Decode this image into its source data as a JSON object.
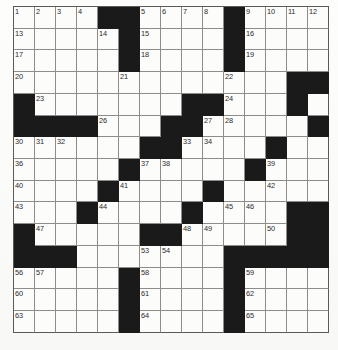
{
  "puzzle": {
    "type": "crossword-grid",
    "rows": 15,
    "columns": 15,
    "cell_size_px": 21,
    "colors": {
      "block": "#1a1a1a",
      "open": "#fcfcfb",
      "grid_line": "#8c8c8c",
      "border": "#5a5a5a",
      "number_text": "#2b2b2b",
      "page_background": "#ffffff"
    },
    "blocks": [
      [
        0,
        4
      ],
      [
        0,
        5
      ],
      [
        0,
        10
      ],
      [
        1,
        5
      ],
      [
        1,
        10
      ],
      [
        2,
        5
      ],
      [
        2,
        10
      ],
      [
        3,
        13
      ],
      [
        3,
        14
      ],
      [
        4,
        0
      ],
      [
        4,
        8
      ],
      [
        4,
        9
      ],
      [
        4,
        13
      ],
      [
        5,
        0
      ],
      [
        5,
        1
      ],
      [
        5,
        2
      ],
      [
        5,
        3
      ],
      [
        5,
        7
      ],
      [
        5,
        8
      ],
      [
        5,
        14
      ],
      [
        6,
        6
      ],
      [
        6,
        7
      ],
      [
        6,
        12
      ],
      [
        7,
        5
      ],
      [
        7,
        11
      ],
      [
        8,
        4
      ],
      [
        8,
        9
      ],
      [
        9,
        3
      ],
      [
        9,
        8
      ],
      [
        9,
        13
      ],
      [
        9,
        14
      ],
      [
        10,
        0
      ],
      [
        10,
        6
      ],
      [
        10,
        7
      ],
      [
        10,
        13
      ],
      [
        10,
        14
      ],
      [
        11,
        0
      ],
      [
        11,
        1
      ],
      [
        11,
        2
      ],
      [
        11,
        10
      ],
      [
        11,
        11
      ],
      [
        11,
        12
      ],
      [
        11,
        13
      ],
      [
        11,
        14
      ],
      [
        12,
        5
      ],
      [
        12,
        10
      ],
      [
        13,
        5
      ],
      [
        13,
        10
      ],
      [
        14,
        5
      ],
      [
        14,
        10
      ]
    ],
    "numbers": [
      {
        "row": 0,
        "col": 0,
        "n": "1"
      },
      {
        "row": 0,
        "col": 1,
        "n": "2"
      },
      {
        "row": 0,
        "col": 2,
        "n": "3"
      },
      {
        "row": 0,
        "col": 3,
        "n": "4"
      },
      {
        "row": 0,
        "col": 6,
        "n": "5"
      },
      {
        "row": 0,
        "col": 7,
        "n": "6"
      },
      {
        "row": 0,
        "col": 8,
        "n": "7"
      },
      {
        "row": 0,
        "col": 9,
        "n": "8"
      },
      {
        "row": 0,
        "col": 11,
        "n": "9"
      },
      {
        "row": 0,
        "col": 12,
        "n": "10"
      },
      {
        "row": 0,
        "col": 13,
        "n": "11"
      },
      {
        "row": 0,
        "col": 14,
        "n": "12"
      },
      {
        "row": 1,
        "col": 0,
        "n": "13"
      },
      {
        "row": 1,
        "col": 4,
        "n": "14"
      },
      {
        "row": 1,
        "col": 6,
        "n": "15"
      },
      {
        "row": 1,
        "col": 11,
        "n": "16"
      },
      {
        "row": 2,
        "col": 0,
        "n": "17"
      },
      {
        "row": 2,
        "col": 6,
        "n": "18"
      },
      {
        "row": 2,
        "col": 11,
        "n": "19"
      },
      {
        "row": 3,
        "col": 0,
        "n": "20"
      },
      {
        "row": 3,
        "col": 5,
        "n": "21"
      },
      {
        "row": 3,
        "col": 10,
        "n": "22"
      },
      {
        "row": 4,
        "col": 1,
        "n": "23"
      },
      {
        "row": 4,
        "col": 10,
        "n": "24"
      },
      {
        "row": 4,
        "col": 13,
        "n": "25"
      },
      {
        "row": 5,
        "col": 4,
        "n": "26"
      },
      {
        "row": 5,
        "col": 9,
        "n": "27"
      },
      {
        "row": 5,
        "col": 10,
        "n": "28"
      },
      {
        "row": 5,
        "col": 14,
        "n": "29"
      },
      {
        "row": 6,
        "col": 0,
        "n": "30"
      },
      {
        "row": 6,
        "col": 1,
        "n": "31"
      },
      {
        "row": 6,
        "col": 2,
        "n": "32"
      },
      {
        "row": 6,
        "col": 8,
        "n": "33"
      },
      {
        "row": 6,
        "col": 9,
        "n": "34"
      },
      {
        "row": 6,
        "col": 12,
        "n": "35"
      },
      {
        "row": 7,
        "col": 0,
        "n": "36"
      },
      {
        "row": 7,
        "col": 6,
        "n": "37"
      },
      {
        "row": 7,
        "col": 7,
        "n": "38"
      },
      {
        "row": 7,
        "col": 12,
        "n": "39"
      },
      {
        "row": 8,
        "col": 0,
        "n": "40"
      },
      {
        "row": 8,
        "col": 5,
        "n": "41"
      },
      {
        "row": 8,
        "col": 12,
        "n": "42"
      },
      {
        "row": 9,
        "col": 0,
        "n": "43"
      },
      {
        "row": 9,
        "col": 4,
        "n": "44"
      },
      {
        "row": 9,
        "col": 10,
        "n": "45"
      },
      {
        "row": 9,
        "col": 11,
        "n": "46"
      },
      {
        "row": 10,
        "col": 1,
        "n": "47"
      },
      {
        "row": 10,
        "col": 8,
        "n": "48"
      },
      {
        "row": 10,
        "col": 9,
        "n": "49"
      },
      {
        "row": 10,
        "col": 12,
        "n": "50"
      },
      {
        "row": 10,
        "col": 13,
        "n": "51"
      },
      {
        "row": 11,
        "col": 2,
        "n": "52"
      },
      {
        "row": 11,
        "col": 6,
        "n": "53"
      },
      {
        "row": 11,
        "col": 7,
        "n": "54"
      },
      {
        "row": 11,
        "col": 14,
        "n": "55"
      },
      {
        "row": 12,
        "col": 0,
        "n": "56"
      },
      {
        "row": 12,
        "col": 1,
        "n": "57"
      },
      {
        "row": 12,
        "col": 6,
        "n": "58"
      },
      {
        "row": 12,
        "col": 11,
        "n": "59"
      },
      {
        "row": 13,
        "col": 0,
        "n": "60"
      },
      {
        "row": 13,
        "col": 6,
        "n": "61"
      },
      {
        "row": 13,
        "col": 11,
        "n": "62"
      },
      {
        "row": 14,
        "col": 0,
        "n": "63"
      },
      {
        "row": 14,
        "col": 6,
        "n": "64"
      },
      {
        "row": 14,
        "col": 11,
        "n": "65"
      }
    ]
  }
}
